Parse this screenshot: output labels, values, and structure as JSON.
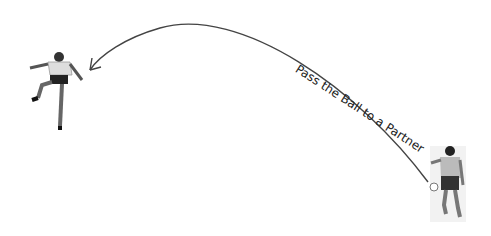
{
  "diagram": {
    "label": "Pass the Ball to a Partner",
    "colors": {
      "line": "#444444",
      "text": "#222222",
      "background": "#ffffff"
    },
    "figures": [
      {
        "name": "receiving-player",
        "pose": "jumping/kicking"
      },
      {
        "name": "passing-player",
        "pose": "kicking ball from behind"
      }
    ]
  }
}
